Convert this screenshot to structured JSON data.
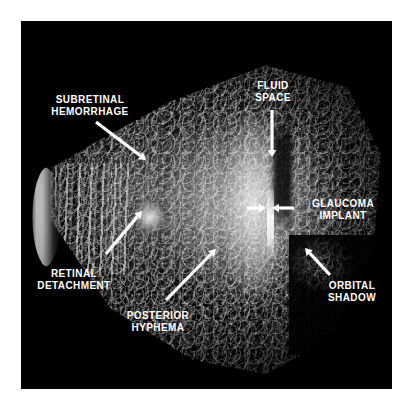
{
  "figure": {
    "kind": "annotated-ultrasound-figure",
    "modality_caption": "",
    "panel_background": "#000000",
    "page_background": "#ffffff",
    "label_color": "#ffffff",
    "arrow_color": "#ffffff"
  },
  "annotations": [
    {
      "id": "subretinal-hemorrhage",
      "lines": "SUBRETINAL\nHEMORRHAGE",
      "label_x": 40,
      "label_y": 94,
      "label_w": 100,
      "align": "center",
      "arrow": {
        "x1": 96,
        "y1": 122,
        "x2": 146,
        "y2": 160,
        "head": 7
      }
    },
    {
      "id": "fluid-space",
      "lines": "FLUID\nSPACE",
      "label_x": 243,
      "label_y": 80,
      "label_w": 60,
      "align": "center",
      "arrow": {
        "x1": 272,
        "y1": 110,
        "x2": 272,
        "y2": 157,
        "head": 7
      }
    },
    {
      "id": "glaucoma-implant",
      "lines": "GLAUCOMA\nIMPLANT",
      "label_x": 300,
      "label_y": 198,
      "label_w": 86,
      "align": "center",
      "arrow": {
        "x1": 294,
        "y1": 208,
        "x2": 272,
        "y2": 208,
        "head": 7
      },
      "arrow2": {
        "x1": 247,
        "y1": 208,
        "x2": 266,
        "y2": 208,
        "head": 7
      }
    },
    {
      "id": "retinal-detachment",
      "lines": "RETINAL\nDETACHMENT",
      "label_x": 22,
      "label_y": 268,
      "label_w": 104,
      "align": "center",
      "arrow": {
        "x1": 106,
        "y1": 254,
        "x2": 142,
        "y2": 211,
        "head": 7
      }
    },
    {
      "id": "posterior-hyphema",
      "lines": "POSTERIOR\nHYPHEMA",
      "label_x": 110,
      "label_y": 310,
      "label_w": 96,
      "align": "center",
      "arrow": {
        "x1": 166,
        "y1": 300,
        "x2": 216,
        "y2": 249,
        "head": 7
      }
    },
    {
      "id": "orbital-shadow",
      "lines": "ORBITAL\nSHADOW",
      "label_x": 312,
      "label_y": 280,
      "label_w": 80,
      "align": "center",
      "arrow": {
        "x1": 330,
        "y1": 275,
        "x2": 305,
        "y2": 248,
        "head": 7
      }
    }
  ]
}
